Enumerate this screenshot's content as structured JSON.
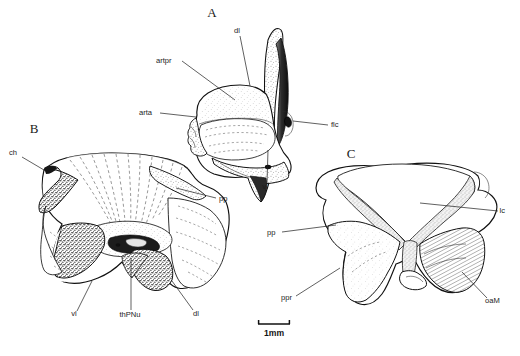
{
  "figure": {
    "type": "scientific-anatomical-illustration",
    "background_color": "#ffffff",
    "ink_color": "#1a1a1a",
    "panels": [
      {
        "id": "A",
        "letter": "A",
        "letter_x": 212,
        "letter_y": 17,
        "view": "lateral",
        "labels": [
          {
            "text": "dl",
            "x": 237,
            "y": 33,
            "anchor": "middle",
            "leader": [
              [
                240,
                36
              ],
              [
                250,
                86
              ]
            ]
          },
          {
            "text": "artpr",
            "x": 156,
            "y": 63,
            "anchor": "start",
            "leader": [
              [
                182,
                61
              ],
              [
                235,
                100
              ]
            ]
          },
          {
            "text": "arta",
            "x": 139,
            "y": 115,
            "anchor": "start",
            "leader": [
              [
                160,
                113
              ],
              [
                196,
                117
              ]
            ]
          },
          {
            "text": "flc",
            "x": 331,
            "y": 127,
            "anchor": "start",
            "leader": [
              [
                328,
                125
              ],
              [
                293,
                121
              ]
            ]
          },
          {
            "text": "vl",
            "x": 265,
            "y": 189,
            "anchor": "middle",
            "leader": [
              [
                267,
                183
              ],
              [
                268,
                150
              ]
            ]
          }
        ]
      },
      {
        "id": "B",
        "letter": "B",
        "letter_x": 34,
        "letter_y": 133,
        "view": "dorsal",
        "labels": [
          {
            "text": "ch",
            "x": 9,
            "y": 155,
            "anchor": "start",
            "leader": [
              [
                22,
                157
              ],
              [
                44,
                170
              ]
            ]
          },
          {
            "text": "pp",
            "x": 219,
            "y": 201,
            "anchor": "start",
            "leader": [
              [
                216,
                198
              ],
              [
                176,
                188
              ]
            ]
          },
          {
            "text": "vl",
            "x": 74,
            "y": 316,
            "anchor": "middle",
            "leader": [
              [
                77,
                311
              ],
              [
                92,
                281
              ]
            ]
          },
          {
            "text": "thPNu",
            "x": 130,
            "y": 317,
            "anchor": "middle",
            "leader": [
              [
                131,
                310
              ],
              [
                131,
                258
              ]
            ]
          },
          {
            "text": "dl",
            "x": 196,
            "y": 316,
            "anchor": "middle",
            "leader": [
              [
                193,
                310
              ],
              [
                172,
                281
              ]
            ]
          }
        ]
      },
      {
        "id": "C",
        "letter": "C",
        "letter_x": 351,
        "letter_y": 158,
        "view": "ventral",
        "labels": [
          {
            "text": "lc",
            "x": 505,
            "y": 213,
            "anchor": "end",
            "leader": [
              [
                498,
                211
              ],
              [
                420,
                203
              ]
            ]
          },
          {
            "text": "pp",
            "x": 267,
            "y": 235,
            "anchor": "start",
            "leader": [
              [
                282,
                232
              ],
              [
                336,
                225
              ]
            ]
          },
          {
            "text": "ppr",
            "x": 281,
            "y": 300,
            "anchor": "start",
            "leader": [
              [
                296,
                296
              ],
              [
                340,
                268
              ]
            ]
          },
          {
            "text": "oaM",
            "x": 485,
            "y": 303,
            "anchor": "start",
            "leader": [
              [
                487,
                298
              ],
              [
                462,
                272
              ]
            ]
          }
        ]
      }
    ],
    "scale_bar": {
      "label": "1mm",
      "x1": 258,
      "x2": 290,
      "y": 324,
      "label_x": 274,
      "label_y": 336
    },
    "abbreviations": [
      "dl",
      "artpr",
      "arta",
      "flc",
      "vl",
      "ch",
      "pp",
      "thPNu",
      "lc",
      "ppr",
      "oaM"
    ]
  }
}
